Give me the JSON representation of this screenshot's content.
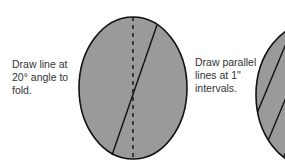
{
  "diagram": {
    "step1": {
      "lines": [
        "Draw line at",
        "20° angle to",
        "fold."
      ]
    },
    "step2": {
      "lines": [
        "Draw parallel",
        "lines at 1\"",
        "intervals."
      ]
    },
    "colors": {
      "fill": "#9a9a9a",
      "stroke": "#111111",
      "text": "#333333"
    }
  }
}
